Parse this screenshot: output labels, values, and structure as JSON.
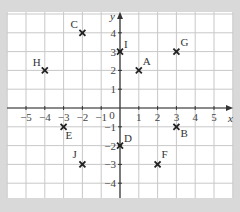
{
  "diagram": {
    "type": "coordinate-grid",
    "x_axis": {
      "label": "x",
      "min": -6,
      "max": 6,
      "ticks": [
        -5,
        -4,
        -3,
        -2,
        -1,
        1,
        2,
        3,
        4,
        5
      ]
    },
    "y_axis": {
      "label": "y",
      "min": -5,
      "max": 5,
      "ticks": [
        -4,
        -3,
        -2,
        -1,
        1,
        2,
        3,
        4
      ]
    },
    "origin_label": "0",
    "points": [
      {
        "name": "A",
        "x": 1,
        "y": 2
      },
      {
        "name": "B",
        "x": 3,
        "y": -1
      },
      {
        "name": "C",
        "x": -2,
        "y": 4
      },
      {
        "name": "D",
        "x": 0,
        "y": -2
      },
      {
        "name": "E",
        "x": -3,
        "y": -1
      },
      {
        "name": "F",
        "x": 2,
        "y": -3
      },
      {
        "name": "G",
        "x": 3,
        "y": 3
      },
      {
        "name": "H",
        "x": -4,
        "y": 2
      },
      {
        "name": "I",
        "x": 0,
        "y": 3
      },
      {
        "name": "J",
        "x": -2,
        "y": -3
      }
    ]
  },
  "colors": {
    "background": "#d9d9d9",
    "paper": "#ffffff",
    "grid": "#c8c8c8",
    "axis": "#333333",
    "marker": "#222222"
  }
}
